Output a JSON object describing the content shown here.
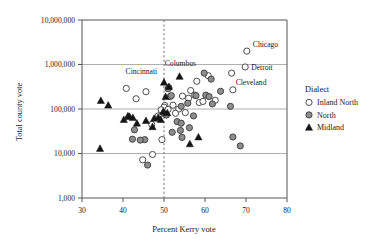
{
  "chart_data": {
    "type": "scatter",
    "title": "",
    "xlabel": "Percent Kerry vote",
    "ylabel": "Total county vote",
    "xlim": [
      30,
      80
    ],
    "ylim": [
      1000,
      10000000
    ],
    "yscale": "log",
    "grid": true,
    "xticks": [
      30,
      40,
      50,
      60,
      70,
      80
    ],
    "xticklabels": [
      "30",
      "40",
      "50",
      "60",
      "70",
      "80"
    ],
    "yticks": [
      1000,
      10000,
      100000,
      1000000,
      10000000
    ],
    "yticklabels": [
      "1,000",
      "10,000",
      "100,000",
      "1,000,000",
      "10,000,000"
    ],
    "reference_line": {
      "orientation": "vertical",
      "x": 50,
      "style": "dashed"
    },
    "legend": {
      "title": "Dialect",
      "position": "right",
      "entries": [
        {
          "name": "Inland North",
          "marker": "open-circle",
          "color": "#ffffff"
        },
        {
          "name": "North",
          "marker": "filled-circle",
          "color": "#8d8d8d"
        },
        {
          "name": "Midland",
          "marker": "filled-triangle",
          "color": "#151515"
        }
      ]
    },
    "annotations": [
      {
        "label": "Chicago",
        "x": 70.2,
        "y": 2000000
      },
      {
        "label": "Detroit",
        "x": 69.8,
        "y": 880000
      },
      {
        "label": "Cleveland",
        "x": 66.5,
        "y": 640000
      },
      {
        "label": "Columbus",
        "x": 54.0,
        "y": 540000
      },
      {
        "label": "Cincinnati",
        "x": 50.3,
        "y": 420000
      }
    ],
    "series": [
      {
        "name": "Inland North",
        "marker": "open-circle",
        "points": [
          [
            70.2,
            2000000
          ],
          [
            69.8,
            880000
          ],
          [
            66.5,
            640000
          ],
          [
            60.8,
            560000
          ],
          [
            58.0,
            420000
          ],
          [
            66.8,
            270000
          ],
          [
            56.5,
            260000
          ],
          [
            57.5,
            205000
          ],
          [
            54.5,
            195000
          ],
          [
            51.5,
            190000
          ],
          [
            56.0,
            175000
          ],
          [
            58.6,
            140000
          ],
          [
            40.8,
            290000
          ],
          [
            43.2,
            170000
          ],
          [
            45.6,
            245000
          ],
          [
            50.2,
            120000
          ],
          [
            52.2,
            122000
          ],
          [
            50.0,
            110000
          ],
          [
            53.6,
            100000
          ],
          [
            51.0,
            98000
          ],
          [
            49.3,
            96000
          ],
          [
            47.0,
            45000
          ],
          [
            49.5,
            20500
          ],
          [
            47.2,
            9500
          ],
          [
            44.8,
            7200
          ],
          [
            62.5,
            157000
          ],
          [
            59.5,
            148000
          ],
          [
            55.2,
            83000
          ],
          [
            52.8,
            80000
          ],
          [
            48.6,
            70000
          ]
        ]
      },
      {
        "name": "North",
        "marker": "filled-circle",
        "points": [
          [
            59.8,
            640000
          ],
          [
            61.5,
            470000
          ],
          [
            63.8,
            250000
          ],
          [
            60.2,
            205000
          ],
          [
            61.0,
            190000
          ],
          [
            61.8,
            130000
          ],
          [
            66.2,
            115000
          ],
          [
            51.8,
            200000
          ],
          [
            51.2,
            300000
          ],
          [
            51.0,
            285000
          ],
          [
            55.8,
            135000
          ],
          [
            54.2,
            115000
          ],
          [
            57.2,
            70000
          ],
          [
            53.2,
            52000
          ],
          [
            54.2,
            48000
          ],
          [
            56.2,
            38000
          ],
          [
            52.0,
            30000
          ],
          [
            54.0,
            33000
          ],
          [
            54.4,
            23000
          ],
          [
            45.3,
            20500
          ],
          [
            44.2,
            20000
          ],
          [
            42.8,
            34000
          ],
          [
            42.3,
            21000
          ],
          [
            66.8,
            23500
          ],
          [
            68.6,
            14800
          ],
          [
            46.0,
            5500
          ],
          [
            50.2,
            77000
          ],
          [
            50.6,
            73000
          ],
          [
            57.8,
            200000
          ]
        ]
      },
      {
        "name": "Midland",
        "marker": "filled-triangle",
        "points": [
          [
            34.6,
            155000
          ],
          [
            36.4,
            122000
          ],
          [
            34.4,
            13000
          ],
          [
            40.2,
            58000
          ],
          [
            41.2,
            70000
          ],
          [
            41.6,
            68000
          ],
          [
            42.4,
            64000
          ],
          [
            43.4,
            48000
          ],
          [
            45.6,
            55000
          ],
          [
            47.2,
            40000
          ],
          [
            47.6,
            62000
          ],
          [
            48.6,
            65000
          ],
          [
            50.0,
            400000
          ],
          [
            50.4,
            190000
          ],
          [
            51.2,
            320000
          ],
          [
            53.8,
            540000
          ],
          [
            49.8,
            88000
          ],
          [
            50.8,
            82000
          ],
          [
            49.2,
            58000
          ],
          [
            56.3,
            16500
          ],
          [
            58.4,
            23500
          ]
        ]
      }
    ]
  }
}
